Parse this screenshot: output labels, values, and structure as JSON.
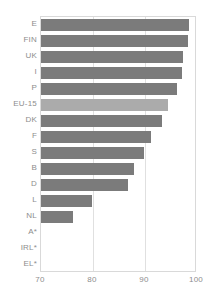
{
  "chart_data": {
    "type": "bar",
    "orientation": "horizontal",
    "title": "",
    "subtitle": "",
    "xlabel": "",
    "ylabel": "",
    "xlim": [
      70,
      100
    ],
    "ylim": null,
    "grid": true,
    "legend": null,
    "xticks": [
      "70",
      "80",
      "90",
      "100"
    ],
    "xtick_values": [
      70,
      80,
      90,
      100
    ],
    "categories": [
      "E",
      "FIN",
      "UK",
      "I",
      "P",
      "EU-15",
      "DK",
      "F",
      "S",
      "B",
      "D",
      "L",
      "NL",
      "A*",
      "IRL*",
      "EL*"
    ],
    "values": [
      98.5,
      98.2,
      97.4,
      97.2,
      96.2,
      94.4,
      93.2,
      91.1,
      89.8,
      87.8,
      86.7,
      79.8,
      76.1,
      null,
      null,
      null
    ],
    "colors": {
      "bar": "#7b7b7b",
      "highlight": "#ababab",
      "axis": "#d9d9d9",
      "grid": "#e0e0e0",
      "text": "#8d8d8d",
      "background": "#ffffff"
    },
    "highlight_category": "EU-15",
    "missing_categories": [
      "A*",
      "IRL*",
      "EL*"
    ],
    "annotations": []
  }
}
